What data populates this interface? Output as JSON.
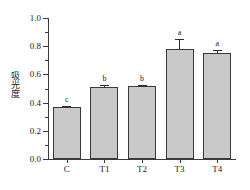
{
  "chart_data": {
    "type": "bar",
    "title": "",
    "xlabel": "",
    "ylabel": "吸光度",
    "categories": [
      "C",
      "T1",
      "T2",
      "T3",
      "T4"
    ],
    "values": [
      0.37,
      0.51,
      0.52,
      0.78,
      0.75
    ],
    "errors": [
      0.008,
      0.012,
      0.008,
      0.07,
      0.025
    ],
    "annotations": [
      "c",
      "b",
      "b",
      "a",
      "a"
    ],
    "ylim": [
      0.0,
      1.0
    ],
    "ytick_labels": [
      "0.0",
      "0.2",
      "0.4",
      "0.6",
      "0.8",
      "1.0"
    ],
    "ytick_values": [
      0.0,
      0.2,
      0.4,
      0.6,
      0.8,
      1.0
    ],
    "yminor_values": [
      0.1,
      0.3,
      0.5,
      0.7,
      0.9
    ],
    "grid": false,
    "legend": false,
    "bar_fill_color": "#c9c9c9",
    "bar_edge_color": "#3a3a3a",
    "axis_color": "#3c3c3c",
    "text_color": "#1a1a1a"
  }
}
